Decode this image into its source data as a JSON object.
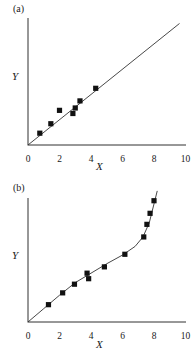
{
  "figure": {
    "background": "#ffffff",
    "ink": "#1a1a1a",
    "marker_color": "#111111",
    "line_color": "#333333"
  },
  "panels": [
    {
      "id": "a",
      "label": "(a)",
      "xlabel": "X",
      "ylabel": "Y"
    },
    {
      "id": "b",
      "label": "(b)",
      "xlabel": "X",
      "ylabel": "Y"
    }
  ],
  "ticks": {
    "x": [
      "0",
      "2",
      "4",
      "6",
      "8",
      "10"
    ]
  },
  "chart_data": [
    {
      "type": "scatter",
      "panel": "a",
      "title": "(a)",
      "xlabel": "X",
      "ylabel": "Y",
      "xlim": [
        0,
        10
      ],
      "ylim": [
        0,
        9
      ],
      "xticks": [
        0,
        2,
        4,
        6,
        8,
        10
      ],
      "yticks": [],
      "grid": false,
      "legend": false,
      "series": [
        {
          "name": "observations",
          "marker": "filled-square",
          "x": [
            0.75,
            1.45,
            2.0,
            2.85,
            3.0,
            3.3,
            4.3
          ],
          "y": [
            0.75,
            1.35,
            2.2,
            2.0,
            2.35,
            2.8,
            3.6
          ]
        },
        {
          "name": "fitted-line",
          "type": "line",
          "x": [
            0,
            9.6
          ],
          "y": [
            0,
            7.7
          ]
        }
      ]
    },
    {
      "type": "scatter",
      "panel": "b",
      "title": "(b)",
      "xlabel": "X",
      "ylabel": "Y",
      "xlim": [
        0,
        10
      ],
      "ylim": [
        0,
        9
      ],
      "xticks": [
        0,
        2,
        4,
        6,
        8,
        10
      ],
      "yticks": [],
      "grid": false,
      "legend": false,
      "series": [
        {
          "name": "observations",
          "marker": "filled-square",
          "x": [
            1.3,
            2.2,
            2.95,
            3.75,
            3.85,
            4.85,
            6.15,
            7.35,
            7.55,
            7.75,
            8.0
          ],
          "y": [
            1.1,
            1.85,
            2.4,
            3.1,
            2.75,
            3.5,
            4.3,
            5.4,
            6.2,
            6.9,
            7.7
          ]
        },
        {
          "name": "fitted-curve",
          "type": "line",
          "x": [
            0,
            1.0,
            2.0,
            3.0,
            4.0,
            5.0,
            6.0,
            6.8,
            7.3,
            7.7,
            8.0,
            8.2
          ],
          "y": [
            0,
            0.85,
            1.7,
            2.5,
            3.1,
            3.7,
            4.25,
            4.8,
            5.4,
            6.3,
            7.5,
            8.3
          ]
        }
      ]
    }
  ]
}
